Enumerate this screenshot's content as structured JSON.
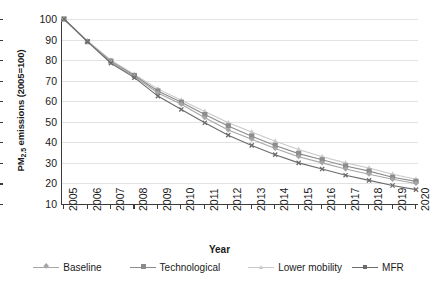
{
  "chart_data": {
    "type": "line",
    "title": "",
    "xlabel": "Year",
    "ylabel_html": "PM<sub>2.5</sub> emissions (2005=100)",
    "ylabel_text": "PM2.5 emissions (2005=100)",
    "grid": "horizontal",
    "legend_position": "bottom",
    "xlim": [
      2005,
      2020
    ],
    "ylim": [
      10,
      100
    ],
    "yticks": [
      100,
      90,
      80,
      70,
      60,
      50,
      40,
      30,
      20,
      10
    ],
    "categories": [
      2005,
      2006,
      2007,
      2008,
      2009,
      2010,
      2011,
      2012,
      2013,
      2014,
      2015,
      2016,
      2017,
      2018,
      2019,
      2020
    ],
    "xtick_labels": [
      "2005",
      "2006",
      "2007",
      "2008",
      "2009",
      "2010",
      "2011",
      "2012",
      "2013",
      "2014",
      "2015",
      "2016",
      "2017",
      "2018",
      "2019",
      "2020"
    ],
    "series": [
      {
        "name": "Baseline",
        "color": "#a6a6a6",
        "marker": "diamond",
        "values": [
          100,
          89,
          79,
          72,
          64,
          58.5,
          52,
          46,
          41.5,
          37,
          33,
          30,
          27,
          24.5,
          22,
          20
        ]
      },
      {
        "name": "Technological",
        "color": "#8c8c8c",
        "marker": "square",
        "values": [
          100,
          89,
          79.5,
          72.5,
          65,
          59.5,
          53.5,
          48,
          43,
          38.5,
          34.5,
          31.5,
          28.5,
          26,
          23,
          21
        ]
      },
      {
        "name": "Lower mobility",
        "color": "#c9c9c9",
        "marker": "triangle",
        "values": [
          100,
          89.5,
          80,
          73,
          66,
          60.5,
          55,
          49.5,
          45,
          40.5,
          36.5,
          33,
          30,
          27.5,
          24.5,
          22
        ]
      },
      {
        "name": "MFR",
        "color": "#6b6b6b",
        "marker": "cross",
        "values": [
          100,
          89,
          78.5,
          71.5,
          62.5,
          56,
          49.5,
          43.5,
          38.5,
          34,
          30,
          27,
          24,
          21.5,
          19,
          17
        ]
      }
    ]
  }
}
